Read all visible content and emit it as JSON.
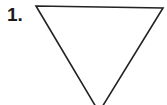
{
  "figure": {
    "background_color": "#ffffff",
    "width": 167,
    "height": 105,
    "label": {
      "text": "1.",
      "color": "#1a1a1a"
    },
    "shape": {
      "name": "inverted-triangle",
      "description": "Downward-pointing triangle outline",
      "fill": "none",
      "stroke_color": "#232323",
      "stroke_width": 1.6,
      "clipped_at_bottom": true,
      "vertices": [
        {
          "name": "top-left",
          "x": 36,
          "y": 6
        },
        {
          "name": "top-right",
          "x": 163,
          "y": 8
        },
        {
          "name": "bottom-apex",
          "x": 99,
          "y": 112
        }
      ],
      "points_attr": "36,6 163,8 99,112"
    }
  }
}
